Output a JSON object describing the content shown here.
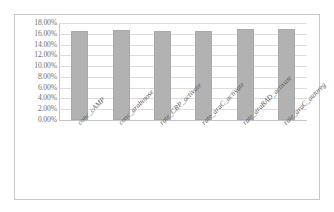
{
  "chart_data": {
    "type": "bar",
    "title": "",
    "subtitle": "",
    "xlabel": "",
    "ylabel": "",
    "categories": [
      "conc_cAMP",
      "conc_arabinose",
      "rate_CRP_activate",
      "rate_araC_activate",
      "rate_araBAD_activate",
      "rate_araC_autoreg"
    ],
    "values": [
      16.6,
      16.65,
      16.55,
      16.6,
      16.8,
      16.8
    ],
    "value_labels": [
      "16.60%",
      "16.65%",
      "16.55%",
      "16.60%",
      "16.80%",
      "16.80%"
    ],
    "ylim": [
      0,
      18
    ],
    "ytick_values": [
      0,
      2,
      4,
      6,
      8,
      10,
      12,
      14,
      16,
      18
    ],
    "ytick_labels": [
      "0.00%",
      "2.00%",
      "4.00%",
      "6.00%",
      "8.00%",
      "10.00%",
      "12.00%",
      "14.00%",
      "16.00%",
      "18.00%"
    ],
    "grid": true,
    "grid_axis": "y",
    "legend": false,
    "legend_position": "none",
    "series": [
      {
        "name": "",
        "values": [
          16.6,
          16.65,
          16.55,
          16.6,
          16.8,
          16.8
        ]
      }
    ],
    "colors": {
      "bar_fill": "#b2b2b2",
      "bar_border": "#a9a9a9",
      "gridline": "#dcdcdc",
      "axis": "#c4c4c4",
      "tick_label": "#6e6e6e",
      "category_label": "#5e5e5e",
      "plot_background": "#ffffff",
      "frame_border": "#c8c8c8"
    }
  }
}
